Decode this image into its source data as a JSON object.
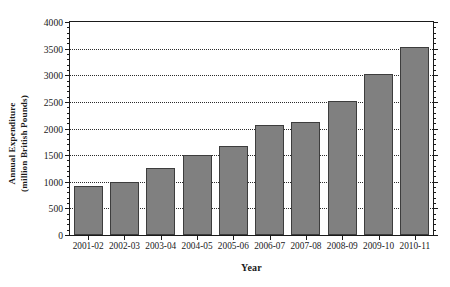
{
  "chart_data": {
    "type": "bar",
    "title": "",
    "xlabel": "Year",
    "ylabel": "Annual Expenditure (million British Pounds)",
    "ylabel_line1": "Annual Expenditure",
    "ylabel_line2": "(million British Pounds)",
    "categories": [
      "2001-02",
      "2002-03",
      "2003-04",
      "2004-05",
      "2005-06",
      "2006-07",
      "2007-08",
      "2008-09",
      "2009-10",
      "2010-11"
    ],
    "values": [
      920,
      1000,
      1260,
      1500,
      1670,
      2060,
      2130,
      2520,
      3030,
      3530
    ],
    "ylim": [
      0,
      4000
    ],
    "ytick_values": [
      0,
      500,
      1000,
      1500,
      2000,
      2500,
      3000,
      3500,
      4000
    ],
    "ytick_labels": [
      "0",
      "500",
      "1000",
      "1500",
      "2000",
      "2500",
      "3000",
      "3500",
      "4000"
    ],
    "yminor_step": 100,
    "grid": true,
    "grid_axis": "y",
    "grid_style": "dotted",
    "legend": false,
    "bar_color": "#808080",
    "bar_edge_color": "#3d3d3d",
    "axis_color": "#1a1a1a",
    "background_color": "#ffffff"
  }
}
